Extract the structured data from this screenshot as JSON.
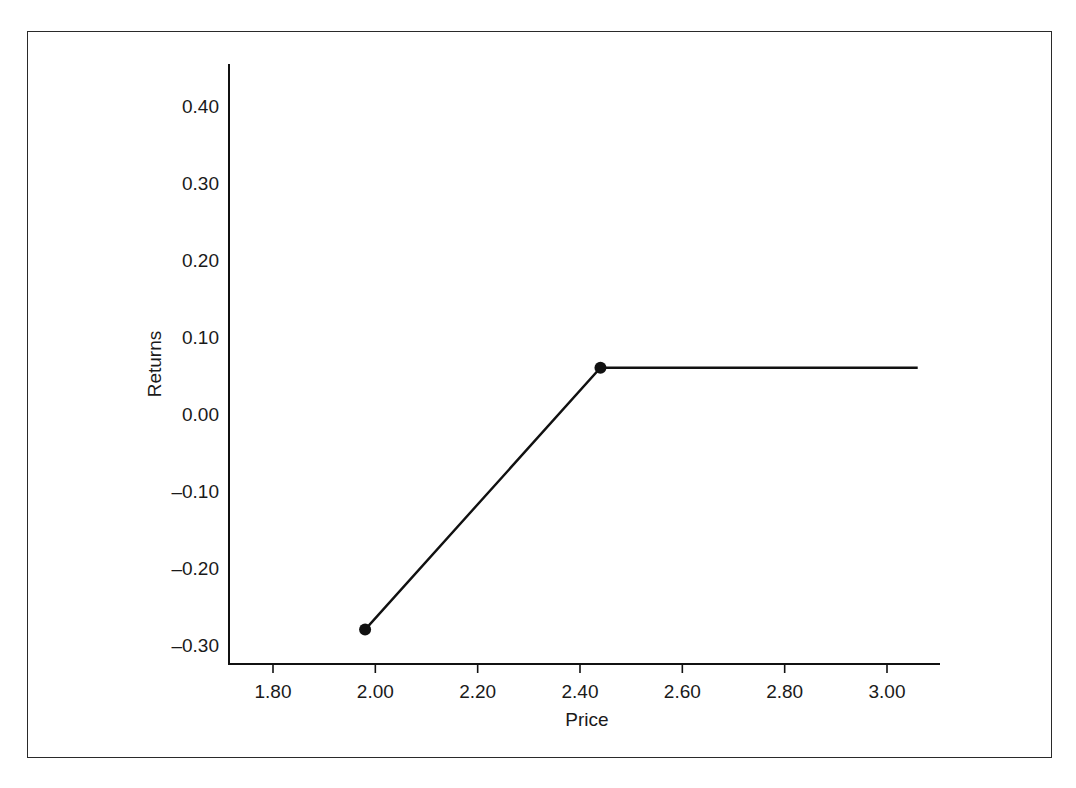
{
  "chart_data": {
    "type": "line",
    "title": "",
    "xlabel": "Price",
    "ylabel": "Returns",
    "xlim": [
      1.71,
      3.11
    ],
    "ylim": [
      -0.32,
      0.47
    ],
    "grid": false,
    "legend": null,
    "x_ticks": [
      1.8,
      2.0,
      2.2,
      2.4,
      2.6,
      2.8,
      3.0
    ],
    "x_tick_labels": [
      "1.80",
      "2.00",
      "2.20",
      "2.40",
      "2.60",
      "2.80",
      "3.00"
    ],
    "y_ticks": [
      0.4,
      0.3,
      0.2,
      0.1,
      0.0,
      -0.1,
      -0.2,
      -0.3
    ],
    "y_tick_labels": [
      "0.40",
      "0.30",
      "0.20",
      "0.10",
      "0.00",
      "–0.10",
      "–0.20",
      "–0.30"
    ],
    "series": [
      {
        "name": "Returns",
        "x": [
          1.98,
          2.44,
          3.06
        ],
        "y": [
          -0.28,
          0.06,
          0.06
        ],
        "markers": [
          {
            "x": 1.98,
            "y": -0.28
          },
          {
            "x": 2.44,
            "y": 0.06
          }
        ],
        "color": "#111111"
      }
    ]
  },
  "axes": {
    "x_title": "Price",
    "y_title": "Returns"
  }
}
